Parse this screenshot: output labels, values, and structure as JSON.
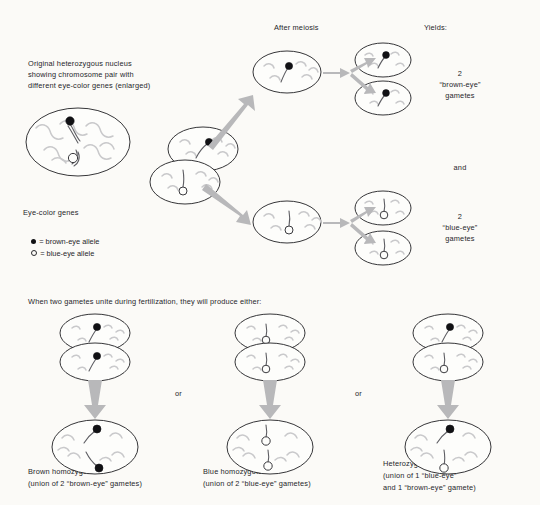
{
  "figure": {
    "background_color": "#fbfaf7",
    "ink_color": "#26262a",
    "arrow_color": "#b8b8ba",
    "chromosome_light_color": "#c9c9cb",
    "chromosome_dark_color": "#5d5d62",
    "brown_allele_color": "#111114",
    "blue_allele_color": "#fdfdfb"
  },
  "top_section": {
    "origin_label": {
      "line1": "Original heterozygous nucleus",
      "line2": "showing chromosome pair with",
      "line3": "different eye-color genes (enlarged)"
    },
    "after_meiosis_header": "After meiosis",
    "yields_header": "Yields:",
    "brown_gametes": {
      "count": "2",
      "name": "“brown-eye”",
      "unit": "gametes"
    },
    "conjunction": "and",
    "blue_gametes": {
      "count": "2",
      "name": "“blue-eye”",
      "unit": "gametes"
    }
  },
  "legend": {
    "title": "Eye-color genes",
    "items": [
      {
        "symbol": "filled-circle",
        "text": "= brown-eye allele"
      },
      {
        "symbol": "open-circle",
        "text": "= blue-eye allele"
      }
    ]
  },
  "bottom_section": {
    "intro": "When two gametes unite during fertilization, they will produce either:",
    "separator_1": "or",
    "separator_2": "or",
    "outcomes": [
      {
        "id": "brown-homozygote",
        "title": "Brown homozygote",
        "subtitle_line1": "(union of 2 “brown-eye” gametes)",
        "subtitle_line2": "",
        "gamete_top": "brown",
        "gamete_bottom": "brown",
        "result_alleles": "brown + brown"
      },
      {
        "id": "blue-homozygote",
        "title": "Blue homozygote",
        "subtitle_line1": "(union of 2 “blue-eye” gametes)",
        "subtitle_line2": "",
        "gamete_top": "blue",
        "gamete_bottom": "blue",
        "result_alleles": "blue + blue"
      },
      {
        "id": "heterozygote",
        "title": "Heterozygote like parent",
        "subtitle_line1": "(union of 1 “blue-eye”",
        "subtitle_line2": "and 1 “brown-eye” gamete)",
        "gamete_top": "brown",
        "gamete_bottom": "blue",
        "result_alleles": "brown + blue"
      }
    ]
  }
}
